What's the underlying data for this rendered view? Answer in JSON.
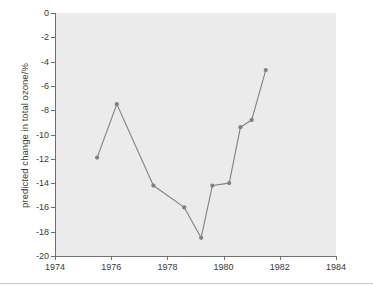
{
  "chart_data": {
    "type": "line",
    "title": "",
    "subtitle": "",
    "xlabel": "",
    "ylabel": "predicted change in total ozone/%",
    "xlim": [
      1974,
      1984
    ],
    "ylim": [
      -20,
      0
    ],
    "xticks": [
      1974,
      1976,
      1978,
      1980,
      1982,
      1984
    ],
    "xtick_labels": [
      "1974",
      "1976",
      "1978",
      "1980",
      "1982",
      "1984"
    ],
    "yticks": [
      0,
      -2,
      -4,
      -6,
      -8,
      -10,
      -12,
      -14,
      -16,
      -18,
      -20
    ],
    "ytick_labels": [
      "0",
      "-2",
      "-4",
      "-6",
      "-8",
      "-10",
      "-12",
      "-14",
      "-16",
      "-18",
      "-20"
    ],
    "grid": false,
    "legend": null,
    "annotations": [],
    "series": [
      {
        "name": "predicted change in total ozone",
        "marker": "circle",
        "color": "#808080",
        "x": [
          1975.5,
          1976.2,
          1977.5,
          1978.6,
          1979.2,
          1979.6,
          1980.2,
          1980.6,
          1981.0,
          1981.5
        ],
        "y": [
          -11.9,
          -7.5,
          -14.2,
          -16.0,
          -18.5,
          -14.2,
          -14.0,
          -9.4,
          -8.8,
          -4.7
        ],
        "points": [
          {
            "x": 1975.5,
            "y": -11.9
          },
          {
            "x": 1976.2,
            "y": -7.5
          },
          {
            "x": 1977.5,
            "y": -14.2
          },
          {
            "x": 1978.6,
            "y": -16.0
          },
          {
            "x": 1979.2,
            "y": -18.5
          },
          {
            "x": 1979.6,
            "y": -14.2
          },
          {
            "x": 1980.2,
            "y": -14.0
          },
          {
            "x": 1980.6,
            "y": -9.4
          },
          {
            "x": 1981.0,
            "y": -8.8
          },
          {
            "x": 1981.5,
            "y": -4.7
          }
        ]
      }
    ]
  },
  "style": {
    "plot_background": "#ebebeb",
    "figure_background": "#ffffff",
    "line_color": "#808080",
    "marker_color": "#808080",
    "axis_color": "#6e6e6e",
    "tick_text_color": "#3a3a3a",
    "rule_color": "#c8c8c8"
  }
}
